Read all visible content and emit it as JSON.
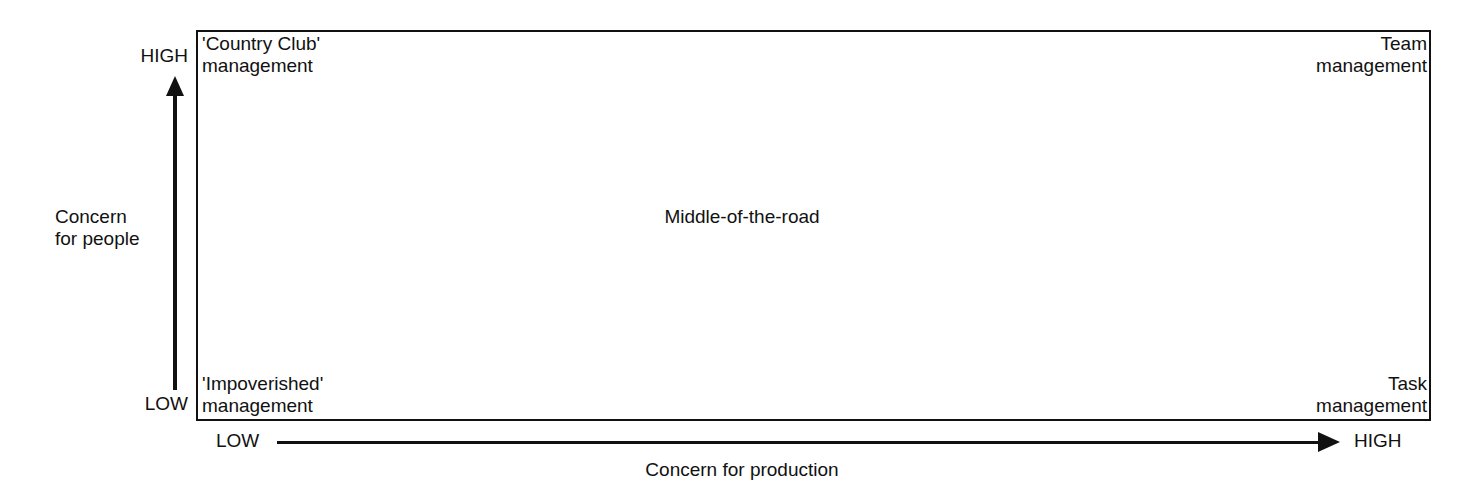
{
  "chart_data": {
    "type": "scatter",
    "title": "",
    "xlabel": "Concern for production",
    "ylabel": "Concern for people",
    "x_ticks": [
      "LOW",
      "HIGH"
    ],
    "y_ticks": [
      "LOW",
      "HIGH"
    ],
    "grid": false,
    "legend": "none",
    "annotations": [
      {
        "position": "top-left",
        "label": "'Country Club'\nmanagement",
        "x": "LOW",
        "y": "HIGH"
      },
      {
        "position": "top-right",
        "label": "Team\nmanagement",
        "x": "HIGH",
        "y": "HIGH"
      },
      {
        "position": "center",
        "label": "Middle-of-the-road",
        "x": "MEDIUM",
        "y": "MEDIUM"
      },
      {
        "position": "bottom-left",
        "label": "'Impoverished'\nmanagement",
        "x": "LOW",
        "y": "LOW"
      },
      {
        "position": "bottom-right",
        "label": "Task\nmanagement",
        "x": "HIGH",
        "y": "LOW"
      }
    ]
  },
  "axes": {
    "y": {
      "title": "Concern\nfor people",
      "high_label": "HIGH",
      "low_label": "LOW"
    },
    "x": {
      "title": "Concern for production",
      "high_label": "HIGH",
      "low_label": "LOW"
    }
  },
  "cells": {
    "top_left": "'Country Club'\nmanagement",
    "top_right": "Team\nmanagement",
    "center": "Middle-of-the-road",
    "bottom_left": "'Impoverished'\nmanagement",
    "bottom_right": "Task\nmanagement"
  },
  "colors": {
    "line": "#111111",
    "background": "#ffffff",
    "text": "#111111"
  }
}
